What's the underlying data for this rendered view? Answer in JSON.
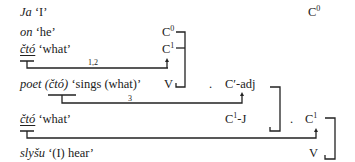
{
  "rows": [
    {
      "word": "Ja",
      "gloss": "‘I’",
      "label_base": "",
      "label_sup": ""
    },
    {
      "word": "on",
      "gloss": "‘he’",
      "label_base": "C",
      "label_sup": "0"
    },
    {
      "word": "čtó",
      "gloss": "‘what’",
      "label_base": "C",
      "label_sup": "1"
    },
    {
      "word": "poet",
      "word_paren": "(čtó)",
      "gloss": "‘sings (what)’",
      "label_base": "V",
      "label_sup": ""
    },
    {
      "word": "čtó",
      "gloss": "‘what’",
      "label_base": "C",
      "label_sup": "1",
      "label_suffix": "-J"
    },
    {
      "word": "slyšu",
      "gloss": "‘(I) hear’",
      "label_base": "V",
      "label_sup": ""
    }
  ],
  "top_right_label": {
    "base": "C",
    "sup": "0"
  },
  "mid_labels": {
    "c_adj": "C′-adj",
    "c1_right": {
      "base": "C",
      "sup": "1"
    },
    "dot1": ".",
    "dot2": ".",
    "dot3": "."
  },
  "arc_labels": {
    "arc1": "1,2",
    "arc2": "3"
  }
}
